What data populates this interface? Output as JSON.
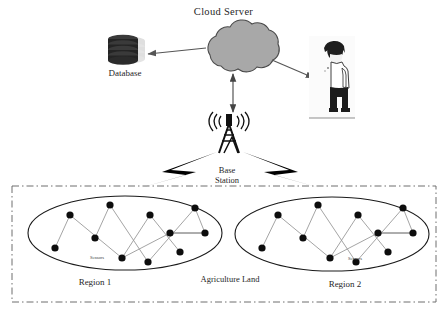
{
  "diagram": {
    "background": "#ffffff",
    "nodes": {
      "cloud_server": {
        "label": "Cloud Server",
        "icon": "cloud-icon",
        "fill": "#a8a8a8",
        "stroke": "#4a4a4a",
        "cx": 237,
        "cy": 52
      },
      "database": {
        "label": "Database",
        "icon": "database-icon",
        "fill": "#2b2b2b",
        "shadow": "#bdbdbd",
        "cx": 125,
        "cy": 52,
        "disks": 4
      },
      "user": {
        "label": "",
        "icon": "person-icon",
        "hair": "#1e1e1e",
        "shirt": "#ffffff",
        "pants": "#1c1c1c",
        "cx": 333,
        "cy": 70
      },
      "base_station": {
        "label_line1": "Base",
        "label_line2": "Station",
        "icon": "cell-tower-icon",
        "stroke": "#111111",
        "cx": 229,
        "cy": 140
      },
      "agriculture_land": {
        "label": "Agriculture Land",
        "border_style": "dash-dot",
        "stroke": "#6f6f6f"
      },
      "region_1": {
        "label": "Region 1",
        "sensors_label": "Sensors",
        "shape": "ellipse",
        "stroke": "#1a1a1a",
        "node_fill": "#0d0d0d",
        "link_stroke": "#9a9a9a",
        "sensor_count": 11
      },
      "region_2": {
        "label": "Region 2",
        "sensors_label": "Sensors",
        "shape": "ellipse",
        "stroke": "#1a1a1a",
        "node_fill": "#0d0d0d",
        "link_stroke": "#9a9a9a",
        "sensor_count": 11
      }
    },
    "links": [
      {
        "name": "cloud-to-database",
        "from": "cloud_server",
        "to": "database",
        "arrow": "single",
        "direction": "left",
        "stroke": "#555555"
      },
      {
        "name": "cloud-to-user",
        "from": "cloud_server",
        "to": "user",
        "arrow": "single",
        "direction": "right-down",
        "stroke": "#555555"
      },
      {
        "name": "cloud-to-base-station",
        "from": "cloud_server",
        "to": "base_station",
        "arrow": "double",
        "direction": "vertical",
        "stroke": "#444444"
      },
      {
        "name": "base-station-to-region-1",
        "from": "base_station",
        "to": "region_1",
        "arrow": "lightning",
        "stroke": "#000000"
      },
      {
        "name": "base-station-to-region-2",
        "from": "base_station",
        "to": "region_2",
        "arrow": "lightning",
        "stroke": "#000000"
      }
    ],
    "region_1_sensors": [
      [
        55,
        248
      ],
      [
        70,
        215
      ],
      [
        95,
        238
      ],
      [
        110,
        205
      ],
      [
        122,
        258
      ],
      [
        150,
        215
      ],
      [
        170,
        233
      ],
      [
        180,
        252
      ],
      [
        195,
        208
      ],
      [
        148,
        262
      ],
      [
        205,
        233
      ]
    ],
    "region_2_sensors": [
      [
        262,
        248
      ],
      [
        278,
        215
      ],
      [
        303,
        238
      ],
      [
        318,
        205
      ],
      [
        330,
        258
      ],
      [
        358,
        215
      ],
      [
        378,
        233
      ],
      [
        388,
        252
      ],
      [
        403,
        208
      ],
      [
        356,
        262
      ],
      [
        413,
        233
      ]
    ]
  }
}
